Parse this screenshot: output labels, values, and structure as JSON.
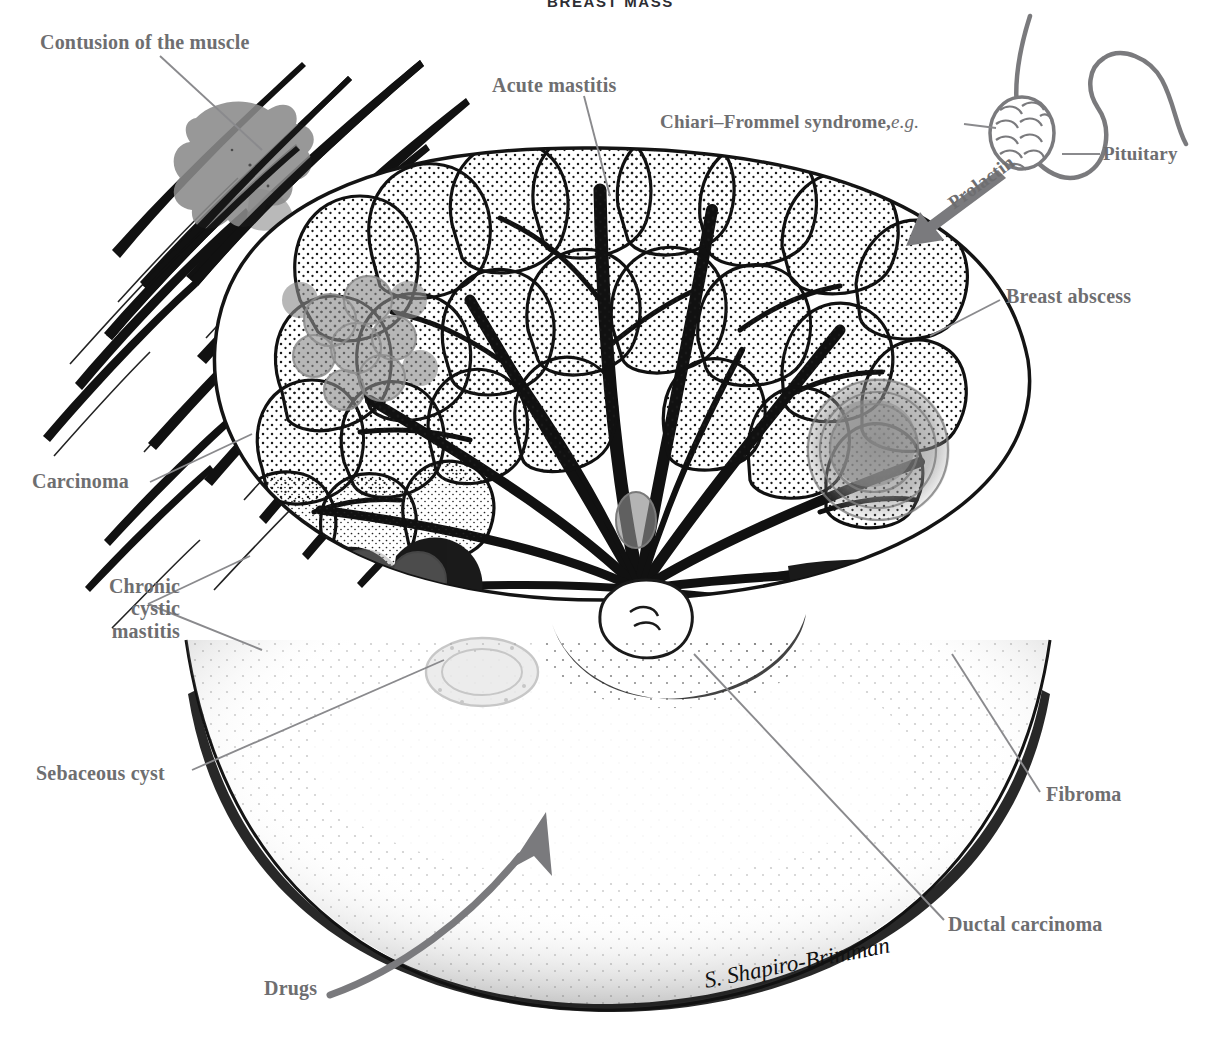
{
  "figure": {
    "title": "BREAST MASS",
    "signature": "S. Shapiro-Brimman",
    "ink_color": "#111111",
    "label_color": "#6e6e70",
    "lesion_gray": "#8c8c8c",
    "background": "#ffffff"
  },
  "labels": {
    "contusion": "Contusion of the muscle",
    "acute_mastitis": "Acute mastitis",
    "chiari": "Chiari–Frommel syndrome,",
    "chiari_eg": "e.g.",
    "pituitary": "Pituitary",
    "prolactin": "Prolactin",
    "breast_abscess": "Breast abscess",
    "carcinoma": "Carcinoma",
    "chronic_cystic_mastitis_l1": "Chronic",
    "chronic_cystic_mastitis_l2": "cystic",
    "chronic_cystic_mastitis_l3": "mastitis",
    "sebaceous_cyst": "Sebaceous cyst",
    "fibroma": "Fibroma",
    "ductal_carcinoma": "Ductal carcinoma",
    "drugs": "Drugs"
  },
  "structures": [
    {
      "name": "pectoral-muscle-striations",
      "position": "upper-left",
      "rendering": "black tapered ink strokes"
    },
    {
      "name": "contusion-lesion",
      "position": "upper-left",
      "rendering": "gray irregular blob"
    },
    {
      "name": "pituitary-gland",
      "position": "upper-right",
      "rendering": "scaled oval with curved stalk"
    },
    {
      "name": "prolactin-arrow",
      "position": "upper-right",
      "rendering": "gray arrow pointing to breast"
    },
    {
      "name": "mammary-lobules",
      "position": "center-upper",
      "rendering": "stippled glandular lobes"
    },
    {
      "name": "lactiferous-ducts",
      "position": "center",
      "rendering": "converging black ducts"
    },
    {
      "name": "nipple-areola",
      "position": "center",
      "rendering": "stippled dome at duct convergence"
    },
    {
      "name": "breast-abscess-lesion",
      "position": "right",
      "rendering": "gray shaded circle"
    },
    {
      "name": "carcinoma-lesion",
      "position": "left",
      "rendering": "gray clustered nodules"
    },
    {
      "name": "cystic-mastitis-cysts",
      "position": "lower-left",
      "rendering": "gray stippled circles"
    },
    {
      "name": "sebaceous-cyst-lesion",
      "position": "lower-left",
      "rendering": "faint gray ring"
    },
    {
      "name": "fibroma-lesion",
      "position": "lower-right",
      "rendering": "concentric whorl"
    },
    {
      "name": "breast-contour",
      "position": "lower",
      "rendering": "stippled skin margin"
    },
    {
      "name": "drugs-arrow",
      "position": "lower-left",
      "rendering": "thick gray curved arrow"
    }
  ]
}
